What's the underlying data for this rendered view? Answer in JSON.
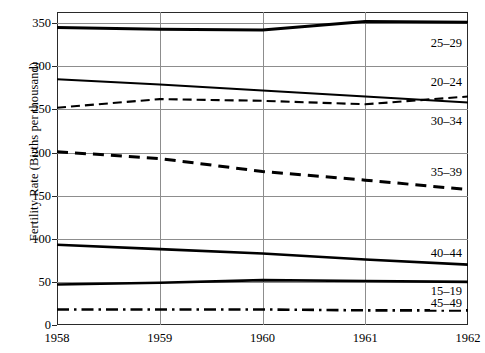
{
  "chart_data": {
    "type": "line",
    "title": "",
    "xlabel": "",
    "ylabel": "Fertility Rate (Births per thousand)",
    "x": [
      1958,
      1959,
      1960,
      1961,
      1962
    ],
    "xtick_labels": [
      "1958",
      "1959",
      "1960",
      "1961",
      "1962"
    ],
    "ytick_labels": [
      "0",
      "50",
      "100",
      "150",
      "200",
      "250",
      "300",
      "350"
    ],
    "yticks": [
      0,
      50,
      100,
      150,
      200,
      250,
      300,
      350
    ],
    "xlim": [
      1958,
      1962
    ],
    "ylim": [
      0,
      363
    ],
    "grid": "both",
    "legend_position": "inline-right",
    "series": [
      {
        "name": "25-29",
        "label": "25–29",
        "values": [
          345,
          343,
          342,
          352,
          351
        ],
        "style": "solid",
        "width": 3.0,
        "color": "#000000",
        "label_y": 327
      },
      {
        "name": "20-24",
        "label": "20–24",
        "values": [
          252,
          262,
          260,
          256,
          265
        ],
        "style": "dashed",
        "width": 2.1,
        "color": "#000000",
        "label_y": 282
      },
      {
        "name": "30-34",
        "label": "30–34",
        "values": [
          285,
          279,
          272,
          265,
          258
        ],
        "style": "solid",
        "width": 2.1,
        "color": "#000000",
        "label_y": 237
      },
      {
        "name": "35-39",
        "label": "35–39",
        "values": [
          201,
          193,
          178,
          168,
          157
        ],
        "style": "dashed",
        "width": 3.0,
        "color": "#000000",
        "label_y": 178
      },
      {
        "name": "40-44",
        "label": "40–44",
        "values": [
          93,
          88,
          83,
          76,
          70
        ],
        "style": "solid",
        "width": 2.6,
        "color": "#000000",
        "label_y": 84
      },
      {
        "name": "15-19",
        "label": "15–19",
        "values": [
          47,
          49,
          52,
          51,
          50
        ],
        "style": "solid",
        "width": 2.6,
        "color": "#000000",
        "label_y": 40
      },
      {
        "name": "45-49",
        "label": "45–49",
        "values": [
          18,
          18,
          18,
          17,
          17
        ],
        "style": "dashdot",
        "width": 2.6,
        "color": "#000000",
        "label_y": 25
      }
    ]
  }
}
